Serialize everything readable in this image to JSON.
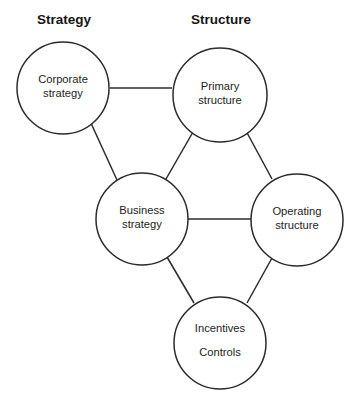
{
  "canvas": {
    "width": 358,
    "height": 406,
    "background": "#ffffff"
  },
  "style": {
    "stroke_color": "#2b2b2b",
    "stroke_width": 1.5,
    "circle_fill": "#ffffff",
    "text_color": "#1d1d1d",
    "heading_color": "#151515"
  },
  "headings": [
    {
      "id": "strategy",
      "label": "Strategy",
      "x": 64,
      "y": 24
    },
    {
      "id": "structure",
      "label": "Structure",
      "x": 221,
      "y": 24
    }
  ],
  "nodes": [
    {
      "id": "corporate-strategy",
      "lines": [
        "Corporate",
        "strategy"
      ],
      "cx": 63,
      "cy": 88,
      "r": 46,
      "line_gap": 14,
      "text_offset": -2
    },
    {
      "id": "primary-structure",
      "lines": [
        "Primary",
        "structure"
      ],
      "cx": 220,
      "cy": 95,
      "r": 47,
      "line_gap": 14,
      "text_offset": -2
    },
    {
      "id": "business-strategy",
      "lines": [
        "Business",
        "strategy"
      ],
      "cx": 142,
      "cy": 219,
      "r": 46,
      "line_gap": 14,
      "text_offset": -2
    },
    {
      "id": "operating-structure",
      "lines": [
        "Operating",
        "structure"
      ],
      "cx": 297,
      "cy": 220,
      "r": 46,
      "line_gap": 14,
      "text_offset": -2
    },
    {
      "id": "incentives-controls",
      "lines": [
        "Incentives",
        "Controls"
      ],
      "cx": 220,
      "cy": 343,
      "r": 46,
      "line_gap": 24,
      "text_offset": -3
    }
  ],
  "connectors": [
    {
      "id": "corporate-to-primary",
      "from": "corporate-strategy",
      "to": "primary-structure",
      "x1": 110,
      "y1": 88,
      "x2": 172,
      "y2": 88
    },
    {
      "id": "corporate-to-business",
      "from": "corporate-strategy",
      "to": "business-strategy",
      "x1": 90,
      "y1": 121,
      "x2": 117,
      "y2": 180
    },
    {
      "id": "primary-to-business",
      "from": "primary-structure",
      "to": "business-strategy",
      "x1": 193,
      "y1": 132,
      "x2": 166,
      "y2": 179
    },
    {
      "id": "primary-to-operating",
      "from": "primary-structure",
      "to": "operating-structure",
      "x1": 245,
      "y1": 129,
      "x2": 272,
      "y2": 179
    },
    {
      "id": "business-to-operating",
      "from": "business-strategy",
      "to": "operating-structure",
      "x1": 188,
      "y1": 219,
      "x2": 251,
      "y2": 219
    },
    {
      "id": "business-to-incentives",
      "from": "business-strategy",
      "to": "incentives-controls",
      "x1": 167,
      "y1": 257,
      "x2": 194,
      "y2": 303
    },
    {
      "id": "operating-to-incentives",
      "from": "operating-structure",
      "to": "incentives-controls",
      "x1": 272,
      "y1": 258,
      "x2": 247,
      "y2": 303
    }
  ]
}
